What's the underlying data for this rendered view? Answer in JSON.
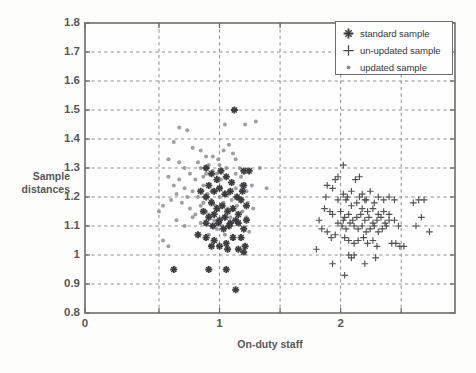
{
  "axes": {
    "ylabel_line1": "Sample",
    "ylabel_line2": "distances",
    "xlabel": "On-duty staff",
    "yticks": [
      "1.8",
      "1.7",
      "1.6",
      "1.5",
      "1.4",
      "1.3",
      "1.2",
      "1.1",
      "1",
      "0.9",
      "0.8"
    ],
    "xticks": [
      "0",
      "1",
      "2"
    ]
  },
  "legend": {
    "items": [
      {
        "label": "standard sample",
        "marker": "bold-plus-marker",
        "color": "#3c3c3e"
      },
      {
        "label": "un-updated sample",
        "marker": "thin-plus-marker",
        "color": "#4a4a4c"
      },
      {
        "label": "updated sample",
        "marker": "dot-marker",
        "color": "#8b8b8d"
      }
    ]
  },
  "chart_data": {
    "type": "scatter",
    "title": "",
    "xlabel": "On-duty staff",
    "ylabel": "Sample distances",
    "xlim": [
      0,
      2.75
    ],
    "ylim": [
      0.8,
      1.8
    ],
    "xticks": [
      0,
      1,
      2
    ],
    "xgridlines": [
      0.55,
      1.0,
      1.45,
      1.9,
      2.35
    ],
    "yticks": [
      0.8,
      0.9,
      1.0,
      1.1,
      1.2,
      1.3,
      1.4,
      1.5,
      1.6,
      1.7,
      1.8
    ],
    "grid": true,
    "legend_position": "top-right",
    "marker_colors": {
      "standard_sample": "#3c3c3e",
      "un_updated_sample": "#4a4a4c",
      "updated_sample": "#8e8e90"
    },
    "series": [
      {
        "name": "updated sample",
        "marker": "dot",
        "color": "#8e8e90",
        "points": [
          [
            0.7,
            1.44
          ],
          [
            0.76,
            1.43
          ],
          [
            0.66,
            1.39
          ],
          [
            0.62,
            1.33
          ],
          [
            0.7,
            1.32
          ],
          [
            0.8,
            1.37
          ],
          [
            0.86,
            1.36
          ],
          [
            0.9,
            1.34
          ],
          [
            0.95,
            1.34
          ],
          [
            0.99,
            1.33
          ],
          [
            1.03,
            1.36
          ],
          [
            1.07,
            1.38
          ],
          [
            1.05,
            1.3
          ],
          [
            1.12,
            1.33
          ],
          [
            1.15,
            1.3
          ],
          [
            1.19,
            1.45
          ],
          [
            1.27,
            1.46
          ],
          [
            1.04,
            1.45
          ],
          [
            0.62,
            1.27
          ],
          [
            0.66,
            1.24
          ],
          [
            0.7,
            1.26
          ],
          [
            0.74,
            1.3
          ],
          [
            0.78,
            1.28
          ],
          [
            0.82,
            1.26
          ],
          [
            0.86,
            1.3
          ],
          [
            0.88,
            1.27
          ],
          [
            0.92,
            1.31
          ],
          [
            0.95,
            1.29
          ],
          [
            0.98,
            1.28
          ],
          [
            1.01,
            1.26
          ],
          [
            1.05,
            1.27
          ],
          [
            1.09,
            1.25
          ],
          [
            1.12,
            1.23
          ],
          [
            1.16,
            1.24
          ],
          [
            1.2,
            1.22
          ],
          [
            1.24,
            1.24
          ],
          [
            1.3,
            1.3
          ],
          [
            1.35,
            1.23
          ],
          [
            0.58,
            1.17
          ],
          [
            0.64,
            1.19
          ],
          [
            0.68,
            1.21
          ],
          [
            0.72,
            1.18
          ],
          [
            0.76,
            1.2
          ],
          [
            0.8,
            1.22
          ],
          [
            0.84,
            1.2
          ],
          [
            0.88,
            1.18
          ],
          [
            0.91,
            1.21
          ],
          [
            0.94,
            1.19
          ],
          [
            0.97,
            1.17
          ],
          [
            1.0,
            1.2
          ],
          [
            1.03,
            1.18
          ],
          [
            1.06,
            1.16
          ],
          [
            1.09,
            1.19
          ],
          [
            1.13,
            1.17
          ],
          [
            1.17,
            1.15
          ],
          [
            1.21,
            1.18
          ],
          [
            1.25,
            1.16
          ],
          [
            1.12,
            1.28
          ],
          [
            0.55,
            1.15
          ],
          [
            0.58,
            1.05
          ],
          [
            0.62,
            1.03
          ],
          [
            0.68,
            1.12
          ],
          [
            0.74,
            1.1
          ],
          [
            0.8,
            1.13
          ],
          [
            0.86,
            1.11
          ],
          [
            0.92,
            1.14
          ],
          [
            0.96,
            1.12
          ],
          [
            1.02,
            1.1
          ],
          [
            1.08,
            1.13
          ],
          [
            1.14,
            1.11
          ],
          [
            1.2,
            1.13
          ],
          [
            1.22,
            1.08
          ],
          [
            0.92,
            1.07
          ],
          [
            0.98,
            1.09
          ],
          [
            1.04,
            1.07
          ],
          [
            0.88,
            1.24
          ],
          [
            0.94,
            1.22
          ],
          [
            1.0,
            1.23
          ],
          [
            1.07,
            1.21
          ],
          [
            1.1,
            1.35
          ],
          [
            1.16,
            1.27
          ],
          [
            0.84,
            1.32
          ],
          [
            0.9,
            1.28
          ],
          [
            1.0,
            1.31
          ],
          [
            0.74,
            1.23
          ],
          [
            0.78,
            1.16
          ],
          [
            0.82,
            1.14
          ],
          [
            0.86,
            1.17
          ],
          [
            0.9,
            1.15
          ]
        ]
      },
      {
        "name": "standard sample",
        "marker": "bold-plus",
        "color": "#3c3c3e",
        "points": [
          [
            0.9,
            1.3
          ],
          [
            0.94,
            1.28
          ],
          [
            0.98,
            1.26
          ],
          [
            1.01,
            1.29
          ],
          [
            1.05,
            1.27
          ],
          [
            1.09,
            1.25
          ],
          [
            0.92,
            1.24
          ],
          [
            0.96,
            1.22
          ],
          [
            1.0,
            1.23
          ],
          [
            1.04,
            1.21
          ],
          [
            1.08,
            1.22
          ],
          [
            1.13,
            1.2
          ],
          [
            1.17,
            1.22
          ],
          [
            0.86,
            1.22
          ],
          [
            0.9,
            1.2
          ],
          [
            0.94,
            1.18
          ],
          [
            0.98,
            1.16
          ],
          [
            1.02,
            1.17
          ],
          [
            1.06,
            1.15
          ],
          [
            1.1,
            1.16
          ],
          [
            1.14,
            1.14
          ],
          [
            0.88,
            1.15
          ],
          [
            0.92,
            1.13
          ],
          [
            0.96,
            1.14
          ],
          [
            1.0,
            1.12
          ],
          [
            1.04,
            1.13
          ],
          [
            1.08,
            1.11
          ],
          [
            1.12,
            1.12
          ],
          [
            0.9,
            1.11
          ],
          [
            0.95,
            1.1
          ],
          [
            0.99,
            1.11
          ],
          [
            1.03,
            1.09
          ],
          [
            1.07,
            1.1
          ],
          [
            1.14,
            1.11
          ],
          [
            1.18,
            1.09
          ],
          [
            1.2,
            1.12
          ],
          [
            0.84,
            1.07
          ],
          [
            0.9,
            1.06
          ],
          [
            0.96,
            1.05
          ],
          [
            0.94,
            1.03
          ],
          [
            1.0,
            1.03
          ],
          [
            1.05,
            1.04
          ],
          [
            1.1,
            1.06
          ],
          [
            1.16,
            1.06
          ],
          [
            1.14,
            1.02
          ],
          [
            1.18,
            1.01
          ],
          [
            1.19,
            1.03
          ],
          [
            1.06,
            1.02
          ],
          [
            0.66,
            0.95
          ],
          [
            0.92,
            0.95
          ],
          [
            1.05,
            0.95
          ],
          [
            1.12,
            0.88
          ],
          [
            1.18,
            1.29
          ],
          [
            1.11,
            1.5
          ],
          [
            1.22,
            1.29
          ],
          [
            1.18,
            1.24
          ],
          [
            1.16,
            1.19
          ],
          [
            1.2,
            1.17
          ]
        ]
      },
      {
        "name": "un-updated sample",
        "marker": "thin-plus",
        "color": "#4a4a4c",
        "points": [
          [
            1.92,
            1.31
          ],
          [
            1.86,
            1.26
          ],
          [
            1.88,
            1.27
          ],
          [
            1.8,
            1.24
          ],
          [
            1.79,
            1.2
          ],
          [
            1.84,
            1.23
          ],
          [
            1.74,
            1.12
          ],
          [
            1.76,
            1.09
          ],
          [
            1.8,
            1.08
          ],
          [
            1.83,
            1.06
          ],
          [
            1.86,
            1.07
          ],
          [
            1.82,
            1.15
          ],
          [
            1.84,
            1.14
          ],
          [
            1.78,
            1.16
          ],
          [
            1.88,
            1.19
          ],
          [
            1.92,
            1.21
          ],
          [
            1.95,
            1.2
          ],
          [
            1.98,
            1.22
          ],
          [
            2.01,
            1.26
          ],
          [
            2.04,
            1.27
          ],
          [
            2.06,
            1.21
          ],
          [
            2.09,
            1.19
          ],
          [
            2.12,
            1.22
          ],
          [
            2.15,
            1.18
          ],
          [
            2.18,
            1.2
          ],
          [
            2.22,
            1.19
          ],
          [
            2.26,
            1.2
          ],
          [
            2.3,
            1.19
          ],
          [
            2.44,
            1.18
          ],
          [
            2.48,
            1.19
          ],
          [
            2.52,
            1.19
          ],
          [
            1.9,
            1.15
          ],
          [
            1.93,
            1.13
          ],
          [
            1.96,
            1.14
          ],
          [
            1.99,
            1.12
          ],
          [
            2.02,
            1.13
          ],
          [
            2.05,
            1.14
          ],
          [
            2.08,
            1.12
          ],
          [
            2.11,
            1.13
          ],
          [
            2.14,
            1.11
          ],
          [
            2.17,
            1.12
          ],
          [
            2.2,
            1.13
          ],
          [
            2.23,
            1.11
          ],
          [
            2.26,
            1.12
          ],
          [
            1.91,
            1.1
          ],
          [
            1.94,
            1.09
          ],
          [
            1.97,
            1.11
          ],
          [
            2.0,
            1.1
          ],
          [
            2.03,
            1.09
          ],
          [
            2.06,
            1.1
          ],
          [
            2.09,
            1.08
          ],
          [
            2.12,
            1.09
          ],
          [
            2.15,
            1.1
          ],
          [
            2.18,
            1.08
          ],
          [
            2.21,
            1.09
          ],
          [
            2.24,
            1.1
          ],
          [
            1.93,
            1.06
          ],
          [
            1.96,
            1.05
          ],
          [
            2.0,
            1.04
          ],
          [
            2.03,
            1.05
          ],
          [
            2.07,
            1.06
          ],
          [
            2.1,
            1.04
          ],
          [
            2.14,
            1.05
          ],
          [
            2.17,
            1.03
          ],
          [
            2.28,
            1.04
          ],
          [
            2.31,
            1.04
          ],
          [
            2.34,
            1.03
          ],
          [
            2.37,
            1.03
          ],
          [
            1.96,
            1.0
          ],
          [
            1.98,
            0.99
          ],
          [
            2.0,
            1.0
          ],
          [
            2.08,
            0.97
          ],
          [
            2.16,
            0.99
          ],
          [
            1.84,
            0.97
          ],
          [
            1.93,
            0.93
          ],
          [
            1.72,
            1.02
          ],
          [
            2.5,
            1.13
          ],
          [
            2.46,
            1.1
          ],
          [
            2.56,
            1.08
          ],
          [
            1.98,
            1.17
          ],
          [
            2.02,
            1.18
          ],
          [
            2.06,
            1.16
          ],
          [
            2.1,
            1.15
          ],
          [
            2.14,
            1.16
          ],
          [
            2.18,
            1.14
          ],
          [
            1.94,
            1.19
          ],
          [
            2.22,
            1.15
          ],
          [
            2.26,
            1.14
          ],
          [
            2.3,
            1.12
          ],
          [
            2.33,
            1.1
          ],
          [
            1.88,
            1.11
          ],
          [
            1.92,
            1.12
          ],
          [
            2.04,
            1.2
          ],
          [
            2.08,
            1.19
          ]
        ]
      }
    ]
  }
}
